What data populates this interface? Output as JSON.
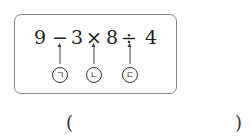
{
  "expression": {
    "tokens": [
      "9",
      "−",
      "3",
      "×",
      "8",
      "÷",
      "4"
    ]
  },
  "markers": [
    {
      "label": "ㄱ",
      "operator": "−"
    },
    {
      "label": "ㄴ",
      "operator": "×"
    },
    {
      "label": "ㄷ",
      "operator": "÷"
    }
  ],
  "answer": {
    "open": "(",
    "close": ")",
    "value": ""
  }
}
